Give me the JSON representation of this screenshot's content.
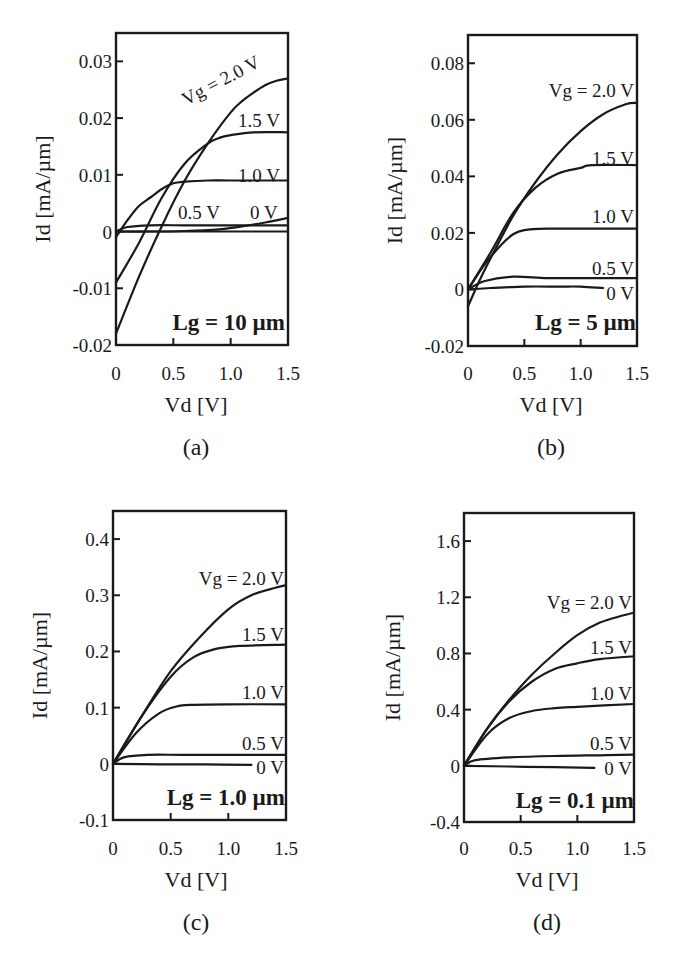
{
  "chart_data": [
    {
      "id": "a",
      "type": "line",
      "panel_label": "(a)",
      "annotation": "Lg = 10 µm",
      "xlabel": "Vd [V]",
      "ylabel": "Id [mA/µm]",
      "xlim": [
        0,
        1.5
      ],
      "ylim": [
        -0.02,
        0.035
      ],
      "xticks": [
        "0",
        "0.5",
        "1.0",
        "1.5"
      ],
      "yticks": [
        "0.03",
        "0.02",
        "0.01",
        "0",
        "-0.01",
        "-0.02"
      ],
      "ytick_values": [
        0.03,
        0.02,
        0.01,
        0,
        -0.01,
        -0.02
      ],
      "grid": false,
      "series": [
        {
          "name": "Vg = 2.0 V",
          "label": "Vg = 2.0 V",
          "x": [
            0,
            0.2,
            0.4,
            0.6,
            0.8,
            1.0,
            1.1,
            1.2,
            1.3,
            1.4,
            1.5
          ],
          "y": [
            -0.018,
            -0.008,
            0.001,
            0.009,
            0.0155,
            0.021,
            0.023,
            0.0245,
            0.0258,
            0.0266,
            0.027
          ]
        },
        {
          "name": "Vg = 1.5 V",
          "label": "1.5 V",
          "x": [
            0,
            0.2,
            0.4,
            0.6,
            0.8,
            0.9,
            1.0,
            1.2,
            1.5
          ],
          "y": [
            -0.009,
            -0.002,
            0.006,
            0.012,
            0.0155,
            0.0165,
            0.017,
            0.0175,
            0.0175
          ]
        },
        {
          "name": "Vg = 1.0 V",
          "label": "1.0 V",
          "x": [
            0,
            0.1,
            0.2,
            0.3,
            0.4,
            0.5,
            0.6,
            0.8,
            1.0,
            1.5
          ],
          "y": [
            -0.001,
            0.002,
            0.0045,
            0.006,
            0.0075,
            0.0085,
            0.0088,
            0.009,
            0.009,
            0.009
          ]
        },
        {
          "name": "Vg = 0.5 V",
          "label": "0.5 V",
          "x": [
            0,
            0.1,
            0.3,
            0.6,
            0.9,
            1.2,
            1.5
          ],
          "y": [
            0,
            0.0008,
            0.0011,
            0.0011,
            0.0011,
            0.0011,
            0.0011
          ]
        },
        {
          "name": "Vg = 0 V",
          "label": "0 V",
          "x": [
            0,
            0.3,
            0.6,
            0.9,
            1.1,
            1.3,
            1.5
          ],
          "y": [
            0,
            0,
            0.0001,
            0.0004,
            0.0009,
            0.0016,
            0.0024
          ]
        },
        {
          "name": "baseline",
          "label": "",
          "x": [
            0,
            1.5
          ],
          "y": [
            0,
            0
          ]
        }
      ]
    },
    {
      "id": "b",
      "type": "line",
      "panel_label": "(b)",
      "annotation": "Lg = 5 µm",
      "xlabel": "Vd [V]",
      "ylabel": "Id [mA/µm]",
      "xlim": [
        0,
        1.5
      ],
      "ylim": [
        -0.02,
        0.09
      ],
      "xticks": [
        "0",
        "0.5",
        "1.0",
        "1.5"
      ],
      "yticks": [
        "0.08",
        "0.06",
        "0.04",
        "0.02",
        "0",
        "-0.02"
      ],
      "ytick_values": [
        0.08,
        0.06,
        0.04,
        0.02,
        0,
        -0.02
      ],
      "grid": false,
      "series": [
        {
          "name": "Vg = 2.0 V",
          "label": "Vg = 2.0 V",
          "x": [
            0,
            0.1,
            0.2,
            0.4,
            0.6,
            0.8,
            1.0,
            1.2,
            1.4,
            1.5
          ],
          "y": [
            -0.006,
            0.003,
            0.011,
            0.026,
            0.038,
            0.048,
            0.056,
            0.062,
            0.0655,
            0.066
          ]
        },
        {
          "name": "Vg = 1.5 V",
          "label": "1.5 V",
          "x": [
            0,
            0.2,
            0.4,
            0.6,
            0.8,
            1.0,
            1.1,
            1.5
          ],
          "y": [
            0,
            0.013,
            0.027,
            0.036,
            0.041,
            0.043,
            0.044,
            0.044
          ]
        },
        {
          "name": "Vg = 1.0 V",
          "label": "1.0 V",
          "x": [
            0,
            0.15,
            0.3,
            0.4,
            0.5,
            0.7,
            1.0,
            1.5
          ],
          "y": [
            0,
            0.009,
            0.016,
            0.0195,
            0.021,
            0.0215,
            0.0215,
            0.0215
          ]
        },
        {
          "name": "Vg = 0.5 V",
          "label": "0.5 V",
          "x": [
            0,
            0.15,
            0.4,
            0.7,
            1.0,
            1.5
          ],
          "y": [
            0,
            0.003,
            0.0045,
            0.004,
            0.004,
            0.004
          ]
        },
        {
          "name": "Vg = 0 V",
          "label": "0 V",
          "x": [
            0,
            0.2,
            0.5,
            0.8,
            1.0,
            1.2
          ],
          "y": [
            0,
            0.0005,
            0.001,
            0.001,
            0.001,
            0.0005
          ]
        }
      ]
    },
    {
      "id": "c",
      "type": "line",
      "panel_label": "(c)",
      "annotation": "Lg = 1.0 µm",
      "xlabel": "Vd [V]",
      "ylabel": "Id [mA/µm]",
      "xlim": [
        0,
        1.5
      ],
      "ylim": [
        -0.1,
        0.45
      ],
      "xticks": [
        "0",
        "0.5",
        "1.0",
        "1.5"
      ],
      "yticks": [
        "0.4",
        "0.3",
        "0.2",
        "0.1",
        "0",
        "-0.1"
      ],
      "ytick_values": [
        0.4,
        0.3,
        0.2,
        0.1,
        0,
        -0.1
      ],
      "grid": false,
      "series": [
        {
          "name": "Vg = 2.0 V",
          "label": "Vg = 2.0 V",
          "x": [
            0,
            0.25,
            0.5,
            0.75,
            1.0,
            1.2,
            1.4,
            1.5
          ],
          "y": [
            0,
            0.085,
            0.165,
            0.225,
            0.275,
            0.3,
            0.313,
            0.318
          ]
        },
        {
          "name": "Vg = 1.5 V",
          "label": "1.5 V",
          "x": [
            0,
            0.25,
            0.5,
            0.7,
            0.9,
            1.1,
            1.5
          ],
          "y": [
            0,
            0.085,
            0.155,
            0.19,
            0.205,
            0.21,
            0.212
          ]
        },
        {
          "name": "Vg = 1.0 V",
          "label": "1.0 V",
          "x": [
            0,
            0.2,
            0.4,
            0.55,
            0.7,
            1.0,
            1.5
          ],
          "y": [
            0,
            0.055,
            0.09,
            0.102,
            0.105,
            0.106,
            0.106
          ]
        },
        {
          "name": "Vg = 0.5 V",
          "label": "0.5 V",
          "x": [
            0,
            0.1,
            0.3,
            0.6,
            1.0,
            1.5
          ],
          "y": [
            0,
            0.012,
            0.016,
            0.016,
            0.016,
            0.016
          ]
        },
        {
          "name": "Vg = 0 V",
          "label": "0 V",
          "x": [
            0,
            0.4,
            0.8,
            1.2
          ],
          "y": [
            0,
            -0.001,
            -0.001,
            -0.002
          ]
        }
      ]
    },
    {
      "id": "d",
      "type": "line",
      "panel_label": "(d)",
      "annotation": "Lg = 0.1 µm",
      "xlabel": "Vd [V]",
      "ylabel": "Id [mA/µm]",
      "xlim": [
        0,
        1.5
      ],
      "ylim": [
        -0.4,
        1.8
      ],
      "xticks": [
        "0",
        "0.5",
        "1.0",
        "1.5"
      ],
      "yticks": [
        "1.6",
        "1.2",
        "0.8",
        "0.4",
        "0",
        "-0.4"
      ],
      "ytick_values": [
        1.6,
        1.2,
        0.8,
        0.4,
        0,
        -0.4
      ],
      "grid": false,
      "series": [
        {
          "name": "Vg = 2.0 V",
          "label": "Vg = 2.0 V",
          "x": [
            0,
            0.2,
            0.4,
            0.6,
            0.8,
            1.0,
            1.2,
            1.4,
            1.5
          ],
          "y": [
            0,
            0.26,
            0.47,
            0.65,
            0.8,
            0.93,
            1.02,
            1.07,
            1.09
          ]
        },
        {
          "name": "Vg = 1.5 V",
          "label": "1.5 V",
          "x": [
            0,
            0.2,
            0.4,
            0.6,
            0.8,
            1.0,
            1.2,
            1.5
          ],
          "y": [
            0,
            0.26,
            0.46,
            0.6,
            0.69,
            0.73,
            0.76,
            0.78
          ]
        },
        {
          "name": "Vg = 1.0 V",
          "label": "1.0 V",
          "x": [
            0,
            0.2,
            0.4,
            0.6,
            0.8,
            1.0,
            1.5
          ],
          "y": [
            0,
            0.22,
            0.34,
            0.39,
            0.41,
            0.42,
            0.44
          ]
        },
        {
          "name": "Vg = 0.5 V",
          "label": "0.5 V",
          "x": [
            0,
            0.1,
            0.4,
            0.8,
            1.2,
            1.5
          ],
          "y": [
            0,
            0.04,
            0.06,
            0.07,
            0.075,
            0.08
          ]
        },
        {
          "name": "Vg = 0 V",
          "label": "0 V",
          "x": [
            0,
            0.4,
            0.8,
            1.15
          ],
          "y": [
            0,
            -0.005,
            -0.01,
            -0.015
          ]
        }
      ]
    }
  ],
  "figure": {
    "panels": [
      {
        "label": "(a)",
        "annotation": "Lg = 10 µm"
      },
      {
        "label": "(b)",
        "annotation": "Lg = 5 µm"
      },
      {
        "label": "(c)",
        "annotation": "Lg = 1.0 µm"
      },
      {
        "label": "(d)",
        "annotation": "Lg = 0.1 µm"
      }
    ],
    "xlabel": "Vd [V]",
    "ylabel": "Id [mA/µm]"
  }
}
